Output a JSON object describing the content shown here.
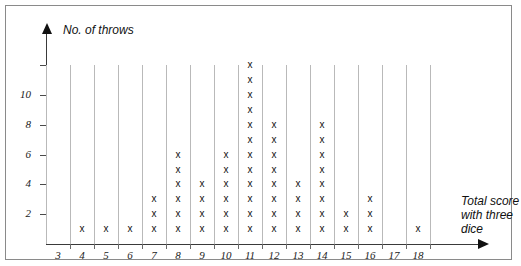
{
  "chart_data": {
    "type": "scatter",
    "title": "",
    "xlabel": "Total score with three dice",
    "ylabel": "No. of throws",
    "categories": [
      3,
      4,
      5,
      6,
      7,
      8,
      9,
      10,
      11,
      12,
      13,
      14,
      15,
      16,
      17,
      18
    ],
    "values": [
      0,
      1,
      1,
      1,
      3,
      6,
      4,
      6,
      12,
      8,
      4,
      8,
      2,
      3,
      0,
      1
    ],
    "x_tick_labels": [
      "3",
      "4",
      "5",
      "6",
      "7",
      "8",
      "9",
      "10",
      "11",
      "12",
      "13",
      "14",
      "15",
      "16",
      "17",
      "18"
    ],
    "y_tick_labels": [
      "2",
      "4",
      "6",
      "8",
      "10"
    ],
    "y_tick_values": [
      2,
      4,
      6,
      8,
      10
    ],
    "y_unlabeled_ticks": [
      12
    ],
    "ylim": [
      0,
      12
    ],
    "xlim": [
      3,
      18
    ],
    "grid": "vertical separators between score columns",
    "legend": "none",
    "marker": "x",
    "marker_color": "#111111",
    "gridline_color": "#b9b9b9",
    "axis_color": "#3a3a3a",
    "total_throws": 60
  },
  "labels": {
    "y_axis_title": "No. of throws",
    "x_axis_title": "Total score with three dice"
  }
}
